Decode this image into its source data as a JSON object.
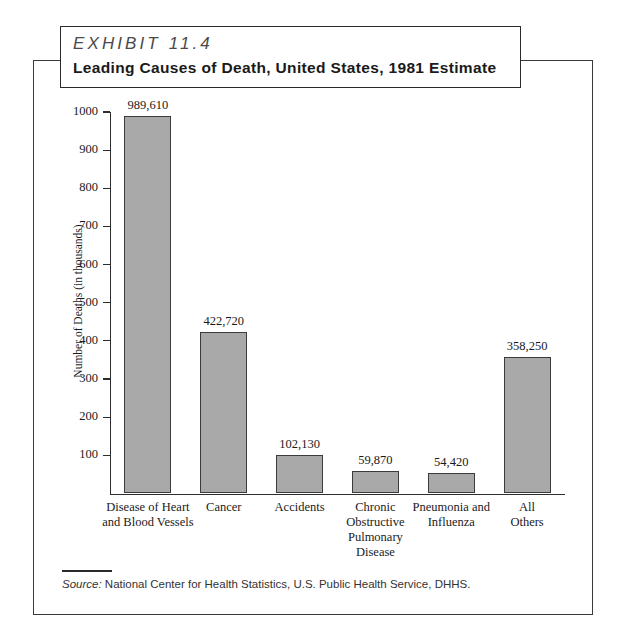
{
  "exhibit": {
    "label": "EXHIBIT 11.4",
    "subtitle": "Leading Causes of Death, United States, 1981 Estimate"
  },
  "source": {
    "prefix": "Source:",
    "text": " National Center for Health Statistics, U.S. Public Health Service, DHHS."
  },
  "colors": {
    "bar_fill": "#a9a9a9",
    "bar_stroke": "#3b3b3b",
    "axis": "#2d2d2d",
    "frame": "#3a3a3a",
    "text": "#1a1a1a"
  },
  "chart_data": {
    "type": "bar",
    "title": "Leading Causes of Death, United States, 1981 Estimate",
    "xlabel": "",
    "ylabel": "Number of Deaths (in thousands)",
    "ylim": [
      0,
      1000
    ],
    "yticks": [
      100,
      200,
      300,
      400,
      500,
      600,
      700,
      800,
      900,
      1000
    ],
    "ytick_labels": [
      "100",
      "200",
      "300",
      "400",
      "500",
      "600",
      "700",
      "800",
      "900",
      "1000"
    ],
    "grid": false,
    "legend": "none",
    "units": "deaths",
    "categories": [
      "Disease of Heart and Blood Vessels",
      "Cancer",
      "Accidents",
      "Chronic Obstructive Pulmonary Disease",
      "Pneumonia and Influenza",
      "All Others"
    ],
    "category_label_lines": [
      [
        "Disease of Heart",
        "and Blood Vessels"
      ],
      [
        "Cancer"
      ],
      [
        "Accidents"
      ],
      [
        "Chronic",
        "Obstructive",
        "Pulmonary",
        "Disease"
      ],
      [
        "Pneumonia and",
        "Influenza"
      ],
      [
        "All",
        "Others"
      ]
    ],
    "values": [
      989610,
      422720,
      102130,
      59870,
      54420,
      358250
    ],
    "values_in_thousands": [
      989.61,
      422.72,
      102.13,
      59.87,
      54.42,
      358.25
    ],
    "data_labels": [
      "989,610",
      "422,720",
      "102,130",
      "59,870",
      "54,420",
      "358,250"
    ]
  }
}
